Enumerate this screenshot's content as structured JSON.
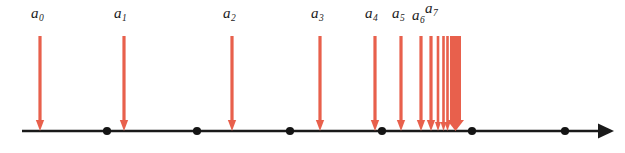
{
  "figure": {
    "accent_color": "#e8604c",
    "axis_color": "#1a1a1a",
    "background_color": "#ffffff"
  },
  "chart_data": {
    "type": "scatter",
    "title": "",
    "subtitle": "",
    "xlabel": "",
    "ylabel": "",
    "grid": false,
    "legend": null,
    "axis": {
      "orientation": "horizontal",
      "x_start_px": 22,
      "x_end_px": 612,
      "y_px": 131,
      "has_right_arrowhead": true,
      "tick_dots_px": [
        107,
        197,
        290,
        382,
        472,
        565
      ]
    },
    "series": [
      {
        "name": "sequence terms",
        "marker": "down-arrow",
        "color": "#e8604c",
        "labeled_points": [
          {
            "label": "a",
            "subscript": "0",
            "x_px": 40,
            "shaft_top_px": 36,
            "tip_px": 131,
            "width_px": 3.2,
            "label_x_px": 31,
            "label_y_px": 6
          },
          {
            "label": "a",
            "subscript": "1",
            "x_px": 124,
            "shaft_top_px": 36,
            "tip_px": 131,
            "width_px": 3.2,
            "label_x_px": 114,
            "label_y_px": 6
          },
          {
            "label": "a",
            "subscript": "2",
            "x_px": 232,
            "shaft_top_px": 36,
            "tip_px": 131,
            "width_px": 3.2,
            "label_x_px": 223,
            "label_y_px": 6
          },
          {
            "label": "a",
            "subscript": "3",
            "x_px": 320,
            "shaft_top_px": 36,
            "tip_px": 131,
            "width_px": 3.2,
            "label_x_px": 311,
            "label_y_px": 6
          },
          {
            "label": "a",
            "subscript": "4",
            "x_px": 375,
            "shaft_top_px": 36,
            "tip_px": 131,
            "width_px": 3.2,
            "label_x_px": 365,
            "label_y_px": 6
          },
          {
            "label": "a",
            "subscript": "5",
            "x_px": 401,
            "shaft_top_px": 36,
            "tip_px": 131,
            "width_px": 3.2,
            "label_x_px": 392,
            "label_y_px": 6
          },
          {
            "label": "a",
            "subscript": "6",
            "x_px": 421,
            "shaft_top_px": 36,
            "tip_px": 131,
            "width_px": 3.2,
            "label_x_px": 412,
            "label_y_px": 8
          },
          {
            "label": "a",
            "subscript": "7",
            "x_px": 431,
            "shaft_top_px": 36,
            "tip_px": 131,
            "width_px": 3.2,
            "label_x_px": 425,
            "label_y_px": 1
          }
        ],
        "unlabeled_points_px": [
          438,
          443.5,
          447.5
        ],
        "accumulation_block": {
          "x_left_px": 450,
          "x_right_px": 461,
          "top_px": 36,
          "tip_px": 131,
          "note": "merged arrows at the limit point"
        }
      }
    ],
    "annotations": [
      {
        "text": "a0",
        "x_px": 31,
        "y_px": 6
      },
      {
        "text": "a1",
        "x_px": 114,
        "y_px": 6
      },
      {
        "text": "a2",
        "x_px": 223,
        "y_px": 6
      },
      {
        "text": "a3",
        "x_px": 311,
        "y_px": 6
      },
      {
        "text": "a4",
        "x_px": 365,
        "y_px": 6
      },
      {
        "text": "a5",
        "x_px": 392,
        "y_px": 6
      },
      {
        "text": "a6",
        "x_px": 412,
        "y_px": 8
      },
      {
        "text": "a7",
        "x_px": 425,
        "y_px": 1
      }
    ]
  },
  "labels": {
    "a0": {
      "base": "a",
      "sub": "0"
    },
    "a1": {
      "base": "a",
      "sub": "1"
    },
    "a2": {
      "base": "a",
      "sub": "2"
    },
    "a3": {
      "base": "a",
      "sub": "3"
    },
    "a4": {
      "base": "a",
      "sub": "4"
    },
    "a5": {
      "base": "a",
      "sub": "5"
    },
    "a6": {
      "base": "a",
      "sub": "6"
    },
    "a7": {
      "base": "a",
      "sub": "7"
    }
  }
}
